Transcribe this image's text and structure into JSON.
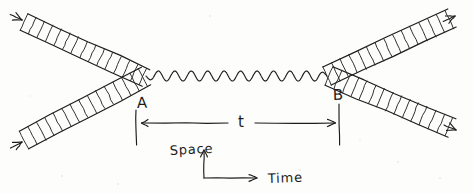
{
  "figure": {
    "background_color": "#fdfdfc",
    "ink_color": "#1c1c1c",
    "width": 473,
    "height": 193,
    "style": "hand-drawn pen sketch"
  },
  "vertices": {
    "a": {
      "label": "A",
      "label_x": 137,
      "label_y": 108,
      "point_x": 143,
      "point_y": 76,
      "tick_x": 136,
      "tick_top": 110,
      "tick_bottom": 145
    },
    "b": {
      "label": "B",
      "label_x": 333,
      "label_y": 100,
      "point_x": 330,
      "point_y": 74,
      "tick_x": 339,
      "tick_top": 104,
      "tick_bottom": 145
    }
  },
  "interval": {
    "label": "t",
    "label_x": 241,
    "label_y": 127,
    "line_y": 123,
    "line_start_x": 139,
    "line_end_x": 337
  },
  "axes": {
    "origin_x": 204,
    "origin_y": 178,
    "vertical_label": "Space",
    "vertical_label_x": 190,
    "vertical_label_y": 155,
    "vertical_top_y": 148,
    "horizontal_label": "Time",
    "horizontal_label_x": 268,
    "horizontal_label_y": 183,
    "horizontal_end_x": 262
  },
  "propagator": {
    "name": "wavy-photon-line",
    "start_x": 146,
    "end_x": 327,
    "center_y": 76,
    "amplitude": 5.0,
    "periods": 11
  },
  "beams": [
    {
      "id": "beam-in-upper",
      "name": "incoming-beam-upper-left",
      "direction": "down-right",
      "arrow": "inward",
      "from_x": 24,
      "from_y": 22,
      "to_x": 146,
      "to_y": 78,
      "half_width": 9,
      "rungs": 14,
      "arrowhead_x": 22,
      "arrowhead_y": 20
    },
    {
      "id": "beam-in-lower",
      "name": "incoming-beam-lower-left",
      "direction": "up-right",
      "arrow": "inward",
      "from_x": 24,
      "from_y": 140,
      "to_x": 146,
      "to_y": 76,
      "half_width": 10,
      "rungs": 14,
      "arrowhead_x": 22,
      "arrowhead_y": 142
    },
    {
      "id": "beam-out-upper",
      "name": "outgoing-beam-upper-right",
      "direction": "up-right",
      "arrow": "outward",
      "from_x": 327,
      "from_y": 76,
      "to_x": 452,
      "to_y": 18,
      "half_width": 10,
      "rungs": 14,
      "arrowhead_x": 455,
      "arrowhead_y": 16
    },
    {
      "id": "beam-out-lower",
      "name": "outgoing-beam-lower-right",
      "direction": "down-right",
      "arrow": "outward",
      "from_x": 329,
      "from_y": 76,
      "to_x": 452,
      "to_y": 128,
      "half_width": 10,
      "rungs": 14,
      "arrowhead_x": 456,
      "arrowhead_y": 130
    }
  ]
}
